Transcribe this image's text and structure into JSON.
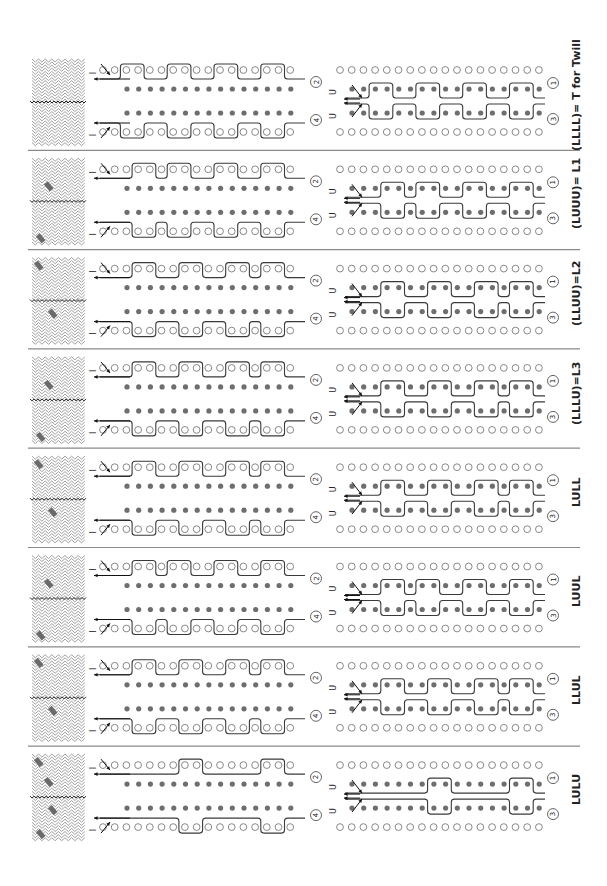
{
  "figure": {
    "colors": {
      "line": "#3a3a3a",
      "filled_peg": "#6e6e6e",
      "open_peg_stroke": "#7a7a7a",
      "divider": "#8a8a8a",
      "weave_stroke": "#888888",
      "weave_float": "#6a6a6a"
    },
    "markers": {
      "top_left": "I",
      "bottom_left": "I",
      "turn_up": "U"
    },
    "circled_numbers": [
      "1",
      "2",
      "3",
      "4"
    ],
    "strips": [
      {
        "label": "(LLLL)= T for Twill",
        "code": "LLLL"
      },
      {
        "label": "(LUUU)= L1",
        "code": "LUUU"
      },
      {
        "label": "(LLUU)=L2",
        "code": "LLUU"
      },
      {
        "label": "(LLLU)=L3",
        "code": "LLLU"
      },
      {
        "label": "LULL",
        "code": "LULL"
      },
      {
        "label": "LUUL",
        "code": "LUUL"
      },
      {
        "label": "LLUL",
        "code": "LLUL"
      },
      {
        "label": "LULU",
        "code": "LULU"
      }
    ]
  }
}
